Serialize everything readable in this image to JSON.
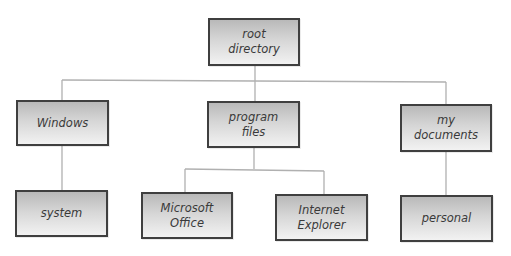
{
  "diagram": {
    "type": "tree",
    "title": "",
    "colors": {
      "border": "#3f3f3f",
      "fill_top": "#b9b9b9",
      "fill_bottom": "#f2f2f2",
      "connector": "#b0b0b0",
      "text": "#3a3a3a"
    },
    "nodes": {
      "root": {
        "label": "root\ndirectory"
      },
      "windows": {
        "label": "Windows"
      },
      "program_files": {
        "label": "program\nfiles"
      },
      "my_documents": {
        "label": "my\ndocuments"
      },
      "system": {
        "label": "system"
      },
      "microsoft_office": {
        "label": "Microsoft\nOffice"
      },
      "internet_explorer": {
        "label": "Internet\nExplorer"
      },
      "personal": {
        "label": "personal"
      }
    },
    "edges": [
      {
        "from": "root",
        "to": "windows"
      },
      {
        "from": "root",
        "to": "program_files"
      },
      {
        "from": "root",
        "to": "my_documents"
      },
      {
        "from": "windows",
        "to": "system"
      },
      {
        "from": "program_files",
        "to": "microsoft_office"
      },
      {
        "from": "program_files",
        "to": "internet_explorer"
      },
      {
        "from": "my_documents",
        "to": "personal"
      }
    ]
  }
}
